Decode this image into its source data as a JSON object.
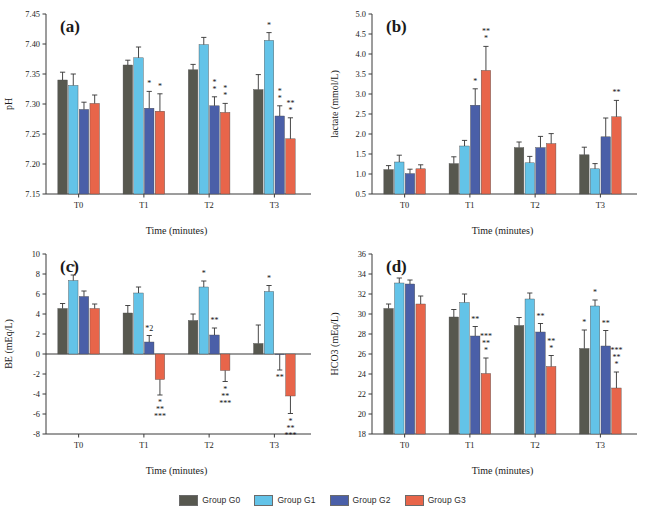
{
  "figure": {
    "groups": [
      {
        "key": "G0",
        "label": "Group G0",
        "color": "#57584f"
      },
      {
        "key": "G1",
        "label": "Group G1",
        "color": "#63c3e8"
      },
      {
        "key": "G2",
        "label": "Group G2",
        "color": "#4a5fa8"
      },
      {
        "key": "G3",
        "label": "Group G3",
        "color": "#e8654a"
      }
    ],
    "legend": {
      "g0": "Group G0",
      "g1": "Group G1",
      "g2": "Group G2",
      "g3": "Group G3"
    }
  },
  "chart_data": [
    {
      "panel": "a",
      "type": "bar",
      "title": "(a)",
      "xlabel": "Time (minutes)",
      "ylabel": "pH",
      "categories": [
        "T0",
        "T1",
        "T2",
        "T3"
      ],
      "ylim": [
        7.15,
        7.45
      ],
      "yticks": [
        7.15,
        7.2,
        7.25,
        7.3,
        7.35,
        7.4,
        7.45
      ],
      "ytick_labels": [
        "7.15",
        "7.20",
        "7.25",
        "7.30",
        "7.35",
        "7.40",
        "7.45"
      ],
      "grid": false,
      "legend_position": "bottom",
      "series": [
        {
          "name": "Group G0",
          "values": [
            7.34,
            7.365,
            7.357,
            7.324
          ],
          "errors": [
            0.013,
            0.008,
            0.009,
            0.025
          ]
        },
        {
          "name": "Group G1",
          "values": [
            7.331,
            7.377,
            7.399,
            7.406
          ],
          "errors": [
            0.019,
            0.018,
            0.012,
            0.013
          ]
        },
        {
          "name": "Group G2",
          "values": [
            7.291,
            7.293,
            7.297,
            7.28
          ],
          "errors": [
            0.012,
            0.028,
            0.015,
            0.017
          ]
        },
        {
          "name": "Group G3",
          "values": [
            7.301,
            7.288,
            7.286,
            7.242
          ],
          "errors": [
            0.014,
            0.029,
            0.015,
            0.035
          ]
        }
      ],
      "annotations": [
        {
          "series": "Group G2",
          "category": "T1",
          "marks": "*"
        },
        {
          "series": "Group G3",
          "category": "T1",
          "marks": "*"
        },
        {
          "series": "Group G2",
          "category": "T2",
          "marks": "*\n*"
        },
        {
          "series": "Group G3",
          "category": "T2",
          "marks": "*\n*"
        },
        {
          "series": "Group G2",
          "category": "T3",
          "marks": "*\n*"
        },
        {
          "series": "Group G3",
          "category": "T3",
          "marks": "*\n**"
        },
        {
          "series": "Group G1",
          "category": "T3",
          "marks": "*"
        }
      ]
    },
    {
      "panel": "b",
      "type": "bar",
      "title": "(b)",
      "xlabel": "Time (minutes)",
      "ylabel": "lactate (mmol/L)",
      "categories": [
        "T0",
        "T1",
        "T2",
        "T3"
      ],
      "ylim": [
        0.5,
        5.0
      ],
      "yticks": [
        0.5,
        1.0,
        1.5,
        2.0,
        2.5,
        3.0,
        3.5,
        4.0,
        4.5,
        5.0
      ],
      "ytick_labels": [
        "0.5",
        "1.0",
        "1.5",
        "2.0",
        "2.5",
        "3.0",
        "3.5",
        "4.0",
        "4.5",
        "5.0"
      ],
      "grid": false,
      "legend_position": "bottom",
      "series": [
        {
          "name": "Group G0",
          "values": [
            1.11,
            1.26,
            1.66,
            1.48
          ],
          "errors": [
            0.1,
            0.17,
            0.14,
            0.19
          ]
        },
        {
          "name": "Group G1",
          "values": [
            1.3,
            1.7,
            1.28,
            1.13
          ],
          "errors": [
            0.17,
            0.14,
            0.16,
            0.13
          ]
        },
        {
          "name": "Group G2",
          "values": [
            1.01,
            2.72,
            1.66,
            1.93
          ],
          "errors": [
            0.11,
            0.41,
            0.28,
            0.47
          ]
        },
        {
          "name": "Group G3",
          "values": [
            1.13,
            3.59,
            1.76,
            2.43
          ],
          "errors": [
            0.1,
            0.6,
            0.25,
            0.41
          ]
        }
      ],
      "annotations": [
        {
          "series": "Group G2",
          "category": "T1",
          "marks": "*"
        },
        {
          "series": "Group G3",
          "category": "T1",
          "marks": "*\n**"
        },
        {
          "series": "Group G3",
          "category": "T3",
          "marks": "**"
        }
      ]
    },
    {
      "panel": "c",
      "type": "bar",
      "title": "(c)",
      "xlabel": "Time (minutes)",
      "ylabel": "BE  (mEq/L)",
      "categories": [
        "T0",
        "T1",
        "T2",
        "T3"
      ],
      "ylim": [
        -8,
        10
      ],
      "yticks": [
        -8,
        -6,
        -4,
        -2,
        0,
        2,
        4,
        6,
        8,
        10
      ],
      "ytick_labels": [
        "-8",
        "-6",
        "-4",
        "-2",
        "0",
        "2",
        "4",
        "6",
        "8",
        "10"
      ],
      "grid": false,
      "legend_position": "bottom",
      "series": [
        {
          "name": "Group G0",
          "values": [
            4.55,
            4.1,
            3.35,
            1.05
          ],
          "errors": [
            0.5,
            0.75,
            0.65,
            1.85
          ]
        },
        {
          "name": "Group G1",
          "values": [
            7.35,
            6.1,
            6.7,
            6.25
          ],
          "errors": [
            0.55,
            0.6,
            0.6,
            0.6
          ]
        },
        {
          "name": "Group G2",
          "values": [
            5.75,
            1.2,
            1.9,
            -0.05
          ],
          "errors": [
            0.55,
            0.65,
            0.7,
            1.55
          ]
        },
        {
          "name": "Group G3",
          "values": [
            4.55,
            -2.55,
            -1.65,
            -4.2
          ],
          "errors": [
            0.45,
            1.55,
            1.1,
            1.75
          ]
        }
      ],
      "annotations": [
        {
          "series": "Group G1",
          "category": "T0",
          "marks": "*"
        },
        {
          "series": "Group G2",
          "category": "T1",
          "marks": "*2"
        },
        {
          "series": "Group G3",
          "category": "T1",
          "marks": "*\n**\n***"
        },
        {
          "series": "Group G1",
          "category": "T2",
          "marks": "*"
        },
        {
          "series": "Group G2",
          "category": "T2",
          "marks": "**"
        },
        {
          "series": "Group G3",
          "category": "T2",
          "marks": "*\n**\n***"
        },
        {
          "series": "Group G1",
          "category": "T3",
          "marks": "*"
        },
        {
          "series": "Group G2",
          "category": "T3",
          "marks": "**"
        },
        {
          "series": "Group G3",
          "category": "T3",
          "marks": "*\n**\n***"
        }
      ]
    },
    {
      "panel": "d",
      "type": "bar",
      "title": "(d)",
      "xlabel": "Time (minutes)",
      "ylabel": "HCO3 (mEq/L)",
      "categories": [
        "T0",
        "T1",
        "T2",
        "T3"
      ],
      "ylim": [
        18,
        36
      ],
      "yticks": [
        18,
        20,
        22,
        24,
        26,
        28,
        30,
        32,
        34,
        36
      ],
      "ytick_labels": [
        "18",
        "20",
        "22",
        "24",
        "26",
        "28",
        "30",
        "32",
        "34",
        "36"
      ],
      "grid": false,
      "legend_position": "bottom",
      "series": [
        {
          "name": "Group G0",
          "values": [
            30.55,
            29.7,
            28.85,
            26.55
          ],
          "errors": [
            0.45,
            0.75,
            0.8,
            1.85
          ]
        },
        {
          "name": "Group G1",
          "values": [
            33.1,
            31.15,
            31.5,
            30.8
          ],
          "errors": [
            0.5,
            0.85,
            0.6,
            0.6
          ]
        },
        {
          "name": "Group G2",
          "values": [
            33.0,
            27.8,
            28.2,
            26.8
          ],
          "errors": [
            0.4,
            0.95,
            0.85,
            1.55
          ]
        },
        {
          "name": "Group G3",
          "values": [
            31.0,
            24.05,
            24.75,
            22.6
          ],
          "errors": [
            0.8,
            1.55,
            1.1,
            1.6
          ]
        }
      ],
      "annotations": [
        {
          "series": "Group G2",
          "category": "T1",
          "marks": "**"
        },
        {
          "series": "Group G3",
          "category": "T1",
          "marks": "*\n**\n***"
        },
        {
          "series": "Group G2",
          "category": "T2",
          "marks": "**"
        },
        {
          "series": "Group G3",
          "category": "T2",
          "marks": "*\n**"
        },
        {
          "series": "Group G0",
          "category": "T3",
          "marks": "*"
        },
        {
          "series": "Group G1",
          "category": "T3",
          "marks": "*"
        },
        {
          "series": "Group G2",
          "category": "T3",
          "marks": "**"
        },
        {
          "series": "Group G3",
          "category": "T3",
          "marks": "*\n**\n***"
        }
      ]
    }
  ]
}
